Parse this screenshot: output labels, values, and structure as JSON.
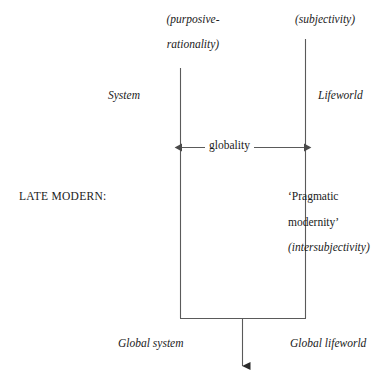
{
  "diagram": {
    "title_text": "LATE MODERN: System / Lifeworld globality diagram",
    "stroke_color": "#5a5a5a",
    "text_color": "#1a1a1a",
    "background_color": "#ffffff",
    "labels": {
      "purposive": "(purposive-",
      "rationality": "rationality)",
      "subjectivity": "(subjectivity)",
      "system": "System",
      "lifeworld": "Lifeworld",
      "globality": "globality",
      "late_modern": "LATE MODERN:",
      "pragmatic": "‘Pragmatic",
      "modernity": "modernity’",
      "intersubjectivity": "(intersubjectivity)",
      "global_system": "Global system",
      "global_lifeworld": "Global lifeworld"
    },
    "geometry": {
      "left_axis_x": 180,
      "left_axis_top": 68,
      "right_axis_x": 305,
      "right_axis_top": 39,
      "axis_bottom": 318,
      "globality_arrow_y": 147,
      "outflow_arrow_x": 242,
      "outflow_arrow_bottom": 366
    }
  }
}
